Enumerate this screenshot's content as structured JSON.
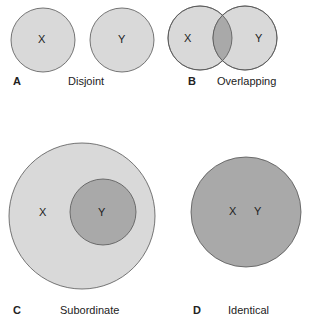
{
  "colors": {
    "light_fill": "#d9d9d9",
    "dark_fill": "#a9a9a9",
    "stroke": "#555555",
    "text": "#222222"
  },
  "panels": [
    {
      "letter": "A",
      "title": "Disjoint",
      "sets": [
        "X",
        "Y"
      ]
    },
    {
      "letter": "B",
      "title": "Overlapping",
      "sets": [
        "X",
        "Y"
      ]
    },
    {
      "letter": "C",
      "title": "Subordinate",
      "sets": [
        "X",
        "Y"
      ]
    },
    {
      "letter": "D",
      "title": "Identical",
      "sets": [
        "X",
        "Y"
      ]
    }
  ]
}
